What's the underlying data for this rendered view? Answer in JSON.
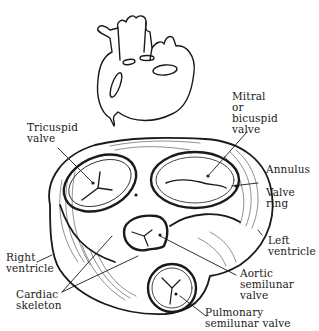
{
  "figure": {
    "type": "heart valves superior view illustration",
    "colors": {
      "ink": "#1a1a1a",
      "background": "#ffffff"
    },
    "labels": {
      "tricuspid": "Tricuspid\nvalve",
      "mitral": "Mitral\nor\nbicuspid\nvalve",
      "annulus": "Annulus",
      "valve_ring": "Valve\nring",
      "left_ventricle": "Left\nventricle",
      "right_ventricle": "Right\nventricle",
      "cardiac_skeleton": "Cardiac\nskeleton",
      "aortic": "Aortic\nsemilunar\nvalve",
      "pulmonary": "Pulmonary\nsemilunar valve"
    }
  }
}
